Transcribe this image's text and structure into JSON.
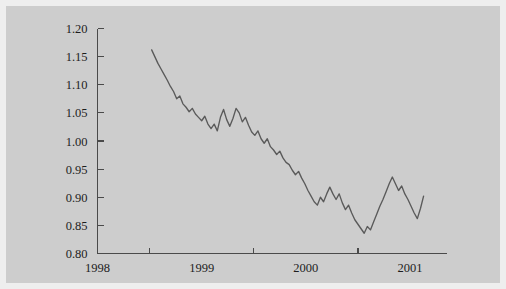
{
  "chart_data": {
    "type": "line",
    "title": "",
    "xlabel": "",
    "ylabel": "",
    "xlim": [
      1998.0,
      2001.35
    ],
    "ylim": [
      0.8,
      1.2
    ],
    "grid": false,
    "legend": null,
    "background_color": "#cdcdcd",
    "line_color": "#5a5a5a",
    "axis_color": "#4a4a4a",
    "text_color": "#1d1d1d",
    "y_ticks": [
      0.8,
      0.85,
      0.9,
      0.95,
      1.0,
      1.05,
      1.1,
      1.15,
      1.2
    ],
    "y_tick_labels": [
      "0.80",
      "0.85",
      "0.90",
      "0.95",
      "1.00",
      "1.05",
      "1.10",
      "1.15",
      "1.20"
    ],
    "x_ticks": [
      1998.5,
      1999.5,
      2000.5
    ],
    "x_tick_labels": [
      "1998",
      "1999",
      "2000",
      "2001"
    ],
    "x_label_positions": [
      1998.0,
      1999.0,
      2000.0,
      2001.0
    ],
    "series": [
      {
        "name": "exchange rate",
        "x": [
          1998.52,
          1998.55,
          1998.58,
          1998.61,
          1998.64,
          1998.67,
          1998.7,
          1998.73,
          1998.76,
          1998.79,
          1998.82,
          1998.85,
          1998.88,
          1998.91,
          1998.94,
          1998.97,
          1999.0,
          1999.03,
          1999.06,
          1999.09,
          1999.12,
          1999.15,
          1999.18,
          1999.21,
          1999.24,
          1999.27,
          1999.3,
          1999.33,
          1999.36,
          1999.39,
          1999.42,
          1999.45,
          1999.48,
          1999.51,
          1999.54,
          1999.57,
          1999.6,
          1999.63,
          1999.66,
          1999.69,
          1999.72,
          1999.75,
          1999.78,
          1999.81,
          1999.84,
          1999.87,
          1999.9,
          1999.93,
          1999.96,
          1999.99,
          2000.02,
          2000.05,
          2000.08,
          2000.11,
          2000.14,
          2000.17,
          2000.2,
          2000.23,
          2000.26,
          2000.29,
          2000.32,
          2000.35,
          2000.38,
          2000.41,
          2000.44,
          2000.47,
          2000.5,
          2000.53,
          2000.56,
          2000.59,
          2000.62,
          2000.65,
          2000.68,
          2000.71,
          2000.74,
          2000.77,
          2000.8,
          2000.83,
          2000.86,
          2000.89,
          2000.92,
          2000.95,
          2000.98,
          2001.01,
          2001.04,
          2001.07,
          2001.1,
          2001.13
        ],
        "y": [
          1.162,
          1.15,
          1.138,
          1.128,
          1.118,
          1.108,
          1.097,
          1.088,
          1.075,
          1.08,
          1.066,
          1.06,
          1.052,
          1.058,
          1.048,
          1.042,
          1.036,
          1.044,
          1.03,
          1.022,
          1.03,
          1.018,
          1.042,
          1.056,
          1.038,
          1.026,
          1.04,
          1.058,
          1.05,
          1.034,
          1.042,
          1.028,
          1.016,
          1.01,
          1.018,
          1.004,
          0.996,
          1.004,
          0.99,
          0.984,
          0.976,
          0.982,
          0.97,
          0.962,
          0.958,
          0.948,
          0.94,
          0.946,
          0.934,
          0.924,
          0.912,
          0.902,
          0.892,
          0.886,
          0.9,
          0.892,
          0.906,
          0.918,
          0.906,
          0.896,
          0.906,
          0.89,
          0.878,
          0.886,
          0.872,
          0.86,
          0.852,
          0.844,
          0.836,
          0.848,
          0.842,
          0.856,
          0.87,
          0.884,
          0.896,
          0.91,
          0.924,
          0.936,
          0.924,
          0.912,
          0.92,
          0.906,
          0.896,
          0.884,
          0.872,
          0.862,
          0.88,
          0.902
        ]
      }
    ]
  }
}
